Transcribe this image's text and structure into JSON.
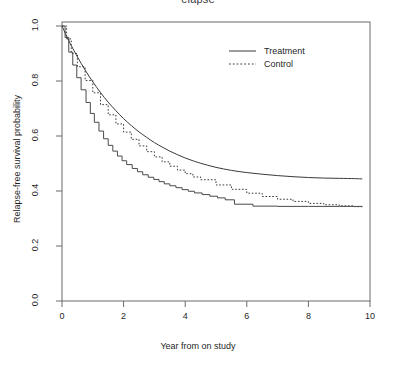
{
  "chart_data": {
    "type": "line",
    "title": "elapse",
    "xlabel": "Year from on study",
    "ylabel": "Relapse-free survival probability",
    "xlim": [
      0,
      10
    ],
    "ylim": [
      0.0,
      1.0
    ],
    "xticks": [
      "0",
      "2",
      "4",
      "6",
      "8",
      "10"
    ],
    "yticks": [
      "0.0",
      "0.2",
      "0.4",
      "0.6",
      "0.8",
      "1.0"
    ],
    "grid": false,
    "legend_position": "top-right",
    "legend": [
      {
        "label": "Treatment",
        "style": "solid"
      },
      {
        "label": "Control",
        "style": "dotted"
      }
    ],
    "series": [
      {
        "name": "Treatment",
        "style": "solid-smooth",
        "x": [
          0.0,
          0.15,
          0.3,
          0.5,
          0.75,
          1.0,
          1.25,
          1.5,
          1.75,
          2.0,
          2.25,
          2.5,
          2.75,
          3.0,
          3.25,
          3.5,
          3.75,
          4.0,
          4.25,
          4.5,
          5.0,
          5.5,
          6.0,
          6.5,
          7.0,
          7.5,
          8.0,
          8.5,
          9.0,
          9.5,
          9.75
        ],
        "y": [
          1.0,
          0.963,
          0.929,
          0.888,
          0.84,
          0.797,
          0.758,
          0.723,
          0.692,
          0.663,
          0.638,
          0.615,
          0.595,
          0.576,
          0.56,
          0.545,
          0.532,
          0.52,
          0.51,
          0.501,
          0.486,
          0.475,
          0.467,
          0.461,
          0.456,
          0.452,
          0.449,
          0.447,
          0.446,
          0.445,
          0.444
        ]
      },
      {
        "name": "Treatment KM",
        "style": "solid-step",
        "x": [
          0.0,
          0.1,
          0.22,
          0.35,
          0.48,
          0.62,
          0.78,
          0.92,
          1.05,
          1.2,
          1.35,
          1.5,
          1.65,
          1.8,
          1.95,
          2.1,
          2.28,
          2.45,
          2.62,
          2.8,
          2.98,
          3.15,
          3.32,
          3.5,
          3.7,
          3.9,
          4.1,
          4.3,
          4.55,
          4.8,
          5.05,
          5.3,
          5.6,
          6.2,
          7.0,
          8.0,
          9.0,
          9.75
        ],
        "y": [
          1.0,
          0.958,
          0.905,
          0.858,
          0.812,
          0.768,
          0.722,
          0.682,
          0.65,
          0.618,
          0.59,
          0.566,
          0.545,
          0.527,
          0.51,
          0.496,
          0.482,
          0.47,
          0.459,
          0.45,
          0.442,
          0.434,
          0.426,
          0.419,
          0.412,
          0.405,
          0.399,
          0.393,
          0.387,
          0.381,
          0.375,
          0.368,
          0.352,
          0.345,
          0.344,
          0.344,
          0.344,
          0.344
        ]
      },
      {
        "name": "Control",
        "style": "dotted-smooth",
        "x": [
          0.0,
          0.15,
          0.3,
          0.5,
          0.75,
          1.0,
          1.25,
          1.5,
          1.75,
          2.0,
          2.25,
          2.5,
          2.75,
          3.0,
          3.25,
          3.5,
          3.75,
          4.0,
          4.25,
          4.5,
          5.0,
          5.5,
          6.0,
          6.5,
          7.0,
          7.5,
          8.0,
          8.5,
          9.0,
          9.5,
          9.75
        ],
        "y": [
          1.0,
          0.953,
          0.9,
          0.852,
          0.802,
          0.757,
          0.714,
          0.677,
          0.644,
          0.614,
          0.588,
          0.564,
          0.543,
          0.524,
          0.506,
          0.49,
          0.476,
          0.463,
          0.451,
          0.441,
          0.422,
          0.406,
          0.392,
          0.38,
          0.37,
          0.362,
          0.355,
          0.35,
          0.346,
          0.343,
          0.342
        ]
      }
    ],
    "plateaus": {
      "treatment": 0.444,
      "control": 0.342
    }
  }
}
